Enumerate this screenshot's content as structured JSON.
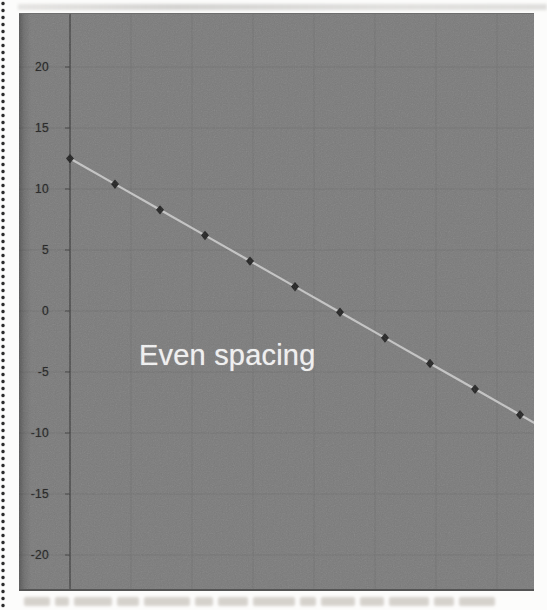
{
  "figure": {
    "annotation": "Even spacing"
  },
  "chart_data": {
    "type": "scatter",
    "title": "",
    "annotation": "Even spacing",
    "x": [
      1,
      2,
      3,
      4,
      5,
      6,
      7,
      8,
      9,
      10,
      11
    ],
    "values": [
      12.5,
      10.4,
      8.3,
      6.2,
      4.1,
      2.0,
      -0.1,
      -2.2,
      -4.3,
      -6.4,
      -8.5
    ],
    "marker": "diamond",
    "y_ticks": [
      "20",
      "15",
      "10",
      "5",
      "0",
      "-5",
      "-10",
      "-15",
      "-20"
    ],
    "ylim": [
      -23,
      24.3
    ],
    "xlabel": "",
    "ylabel": "",
    "grid": true,
    "legend": false,
    "colors": {
      "page_background": "#fcfcfb",
      "plot_background": "#7b7b7b",
      "gridline": "#6f6f6f",
      "axis": "#3c3c3c",
      "tick_label": "#1f1f1f",
      "marker": "#1c1c1c",
      "line": "#c9c9c9",
      "annotation": "#f4f4f4",
      "perforation_dot": "#2c2c2c"
    }
  }
}
